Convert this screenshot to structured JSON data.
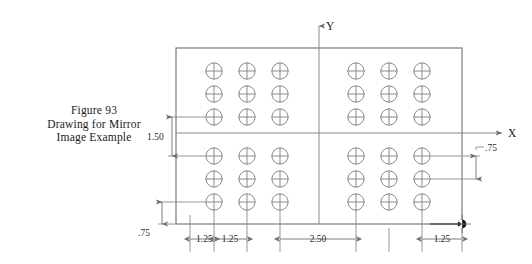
{
  "figure": {
    "caption_lines": [
      "Figure 93",
      "Drawing for Mirror",
      "Image Example"
    ],
    "caption_text": "Figure 93 Drawing for Mirror Image Example"
  },
  "drawing": {
    "axes": {
      "x_label": "X",
      "y_label": "Y"
    },
    "dimensions": {
      "vertical_left": "1.50",
      "vertical_left_lower": ".75",
      "vertical_right": ".75",
      "horizontal_chain": [
        "1.25",
        "1.25",
        "2.50",
        "1.25"
      ]
    },
    "symbols": {
      "hole": "circle-crosshair",
      "datum": "datum-target-filled"
    },
    "hole_groups": [
      {
        "name": "upper-left-group",
        "rows": 3,
        "cols": 3
      },
      {
        "name": "upper-right-group",
        "rows": 3,
        "cols": 3
      },
      {
        "name": "lower-left-group",
        "rows": 3,
        "cols": 3
      },
      {
        "name": "lower-right-group",
        "rows": 3,
        "cols": 3
      }
    ],
    "hole_count": 36,
    "colors": {
      "line": "#8a8a8a",
      "outline": "#6f6f6f",
      "text": "#1a1a1a",
      "datum": "#111111",
      "background": "#ffffff"
    }
  }
}
